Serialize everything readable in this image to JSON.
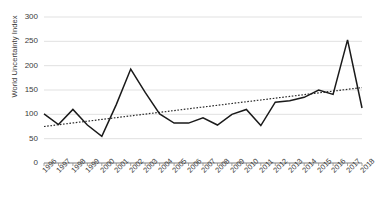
{
  "chart_data": {
    "type": "line",
    "title": "",
    "xlabel": "",
    "ylabel": "World Uncertainty Index",
    "ylim": [
      0,
      300
    ],
    "yticks": [
      0,
      50,
      100,
      150,
      200,
      250,
      300
    ],
    "ytick_labels": [
      "0",
      "50",
      "100",
      "150",
      "200",
      "250",
      "300"
    ],
    "grid": true,
    "legend": "none",
    "categories": [
      "1996",
      "1997",
      "1998",
      "1999",
      "2000",
      "2001",
      "2002",
      "2003",
      "2004",
      "2005",
      "2006",
      "2007",
      "2008",
      "2009",
      "2010",
      "2011",
      "2012",
      "2013",
      "2014",
      "2015",
      "2016",
      "2017",
      "2018"
    ],
    "series": [
      {
        "name": "World Uncertainty Index",
        "style": "solid",
        "color": "#1a1a1a",
        "values": [
          101,
          79,
          110,
          78,
          55,
          120,
          193,
          145,
          101,
          82,
          82,
          93,
          78,
          100,
          110,
          77,
          125,
          128,
          135,
          150,
          141,
          253,
          113
        ]
      },
      {
        "name": "Linear trend",
        "style": "dotted",
        "color": "#2b2b2b",
        "values": [
          75,
          78.6,
          82.3,
          85.9,
          89.5,
          93.2,
          96.8,
          100.5,
          104.1,
          107.7,
          111.4,
          115,
          118.6,
          122.3,
          125.9,
          129.5,
          133.2,
          136.8,
          140.5,
          144.1,
          147.7,
          151.4,
          155
        ]
      }
    ]
  },
  "axes": {
    "y_title": "World Uncertainty Index"
  },
  "colors": {
    "series_line": "#1a1a1a",
    "trend_line": "#2b2b2b",
    "grid": "#d9d9d9",
    "axis": "#8c8c8c",
    "text": "#3b3b3b"
  }
}
